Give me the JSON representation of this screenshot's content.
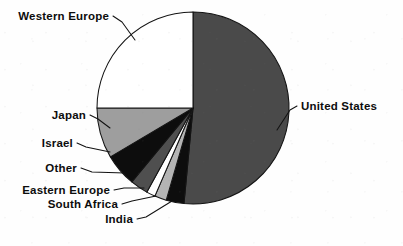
{
  "chart_data": {
    "type": "pie",
    "title": "",
    "subtitle": "",
    "xlabel": "",
    "ylabel": "",
    "legend_position": "none",
    "grid": false,
    "labels_outside": true,
    "start_angle_deg": 0,
    "direction": "clockwise",
    "categories": [
      "United States",
      "India",
      "South Africa",
      "Eastern Europe",
      "Other",
      "Israel",
      "Japan",
      "Western Europe"
    ],
    "values": [
      51.5,
      3.0,
      2.0,
      1.5,
      3.0,
      5.5,
      8.5,
      25.0
    ],
    "units": "percent",
    "slices": [
      {
        "label": "United States",
        "value": 51.5,
        "color": "#4a4a4a",
        "start_deg": 0,
        "end_deg": 185.4,
        "label_side": "right"
      },
      {
        "label": "India",
        "value": 3.0,
        "color": "#0d0d0d",
        "start_deg": 185.4,
        "end_deg": 196.2,
        "label_side": "left"
      },
      {
        "label": "South Africa",
        "value": 2.0,
        "color": "#b4b4b4",
        "start_deg": 196.2,
        "end_deg": 203.4,
        "label_side": "left"
      },
      {
        "label": "Eastern Europe",
        "value": 1.5,
        "color": "#ffffff",
        "start_deg": 203.4,
        "end_deg": 208.8,
        "label_side": "left"
      },
      {
        "label": "Other",
        "value": 3.0,
        "color": "#4f4f4f",
        "start_deg": 208.8,
        "end_deg": 219.6,
        "label_side": "left"
      },
      {
        "label": "Israel",
        "value": 5.5,
        "color": "#0d0d0d",
        "start_deg": 219.6,
        "end_deg": 239.4,
        "label_side": "left"
      },
      {
        "label": "Japan",
        "value": 8.5,
        "color": "#9e9e9e",
        "start_deg": 239.4,
        "end_deg": 270.0,
        "label_side": "left"
      },
      {
        "label": "Western Europe",
        "value": 25.0,
        "color": "#ffffff",
        "start_deg": 270.0,
        "end_deg": 360.0,
        "label_side": "left"
      }
    ],
    "geometry": {
      "center_x": 193,
      "center_y": 108,
      "radius": 96
    }
  },
  "labels": {
    "western_europe": "Western Europe",
    "japan": "Japan",
    "israel": "Israel",
    "other": "Other",
    "eastern_europe": "Eastern Europe",
    "south_africa": "South Africa",
    "india": "India",
    "united_states": "United States"
  },
  "colors": {
    "background": "#fefefe",
    "outline": "#141414",
    "text": "#0d0d0d",
    "united_states": "#4a4a4a",
    "western_europe": "#ffffff",
    "japan": "#9e9e9e",
    "israel": "#0d0d0d",
    "other": "#4f4f4f",
    "eastern_europe": "#ffffff",
    "south_africa": "#b4b4b4",
    "india": "#0d0d0d"
  }
}
